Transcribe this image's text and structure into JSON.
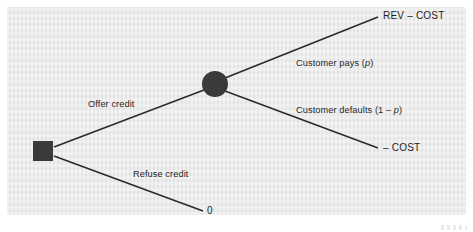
{
  "diagram": {
    "type": "decision-tree",
    "background_color": "#e9e9e9",
    "node_color": "#3a3a3a",
    "line_color": "#2a2a2a",
    "nodes": [
      {
        "id": "decision",
        "shape": "square",
        "x": 43,
        "y": 151,
        "size": 20
      },
      {
        "id": "chance",
        "shape": "circle",
        "x": 215,
        "y": 84,
        "radius": 13
      }
    ],
    "branches": {
      "offer_credit": "Offer credit",
      "refuse_credit": "Refuse credit",
      "customer_pays_prefix": "Customer pays (",
      "customer_pays_var": "p",
      "customer_pays_suffix": ")",
      "customer_defaults_prefix": "Customer defaults (1 – ",
      "customer_defaults_var": "p",
      "customer_defaults_suffix": ")"
    },
    "terminals": {
      "rev_minus_cost": "REV – COST",
      "minus_cost": "– COST",
      "zero": "0"
    }
  }
}
